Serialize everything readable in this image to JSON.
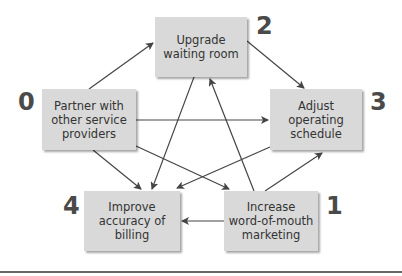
{
  "diagram": {
    "nodes": [
      {
        "id": "0",
        "label": "Partner with other service providers",
        "lines": [
          "Partner with",
          "other service",
          "providers"
        ]
      },
      {
        "id": "1",
        "label": "Increase word-of-mouth marketing",
        "lines": [
          "Increase",
          "word-of-mouth",
          "marketing"
        ]
      },
      {
        "id": "2",
        "label": "Upgrade waiting room",
        "lines": [
          "Upgrade",
          "waiting room"
        ]
      },
      {
        "id": "3",
        "label": "Adjust operating schedule",
        "lines": [
          "Adjust",
          "operating",
          "schedule"
        ]
      },
      {
        "id": "4",
        "label": "Improve accuracy of billing",
        "lines": [
          "Improve",
          "accuracy of",
          "billing"
        ]
      }
    ],
    "edges": [
      {
        "from": "0",
        "to": "2"
      },
      {
        "from": "0",
        "to": "3"
      },
      {
        "from": "0",
        "to": "4"
      },
      {
        "from": "0",
        "to": "1"
      },
      {
        "from": "2",
        "to": "3"
      },
      {
        "from": "2",
        "to": "4"
      },
      {
        "from": "1",
        "to": "2"
      },
      {
        "from": "1",
        "to": "3"
      },
      {
        "from": "1",
        "to": "4"
      },
      {
        "from": "3",
        "to": "4"
      }
    ],
    "colors": {
      "box": "#d9d9d9",
      "arrow": "#444444",
      "text": "#333333",
      "number": "#4a4a4a"
    }
  }
}
